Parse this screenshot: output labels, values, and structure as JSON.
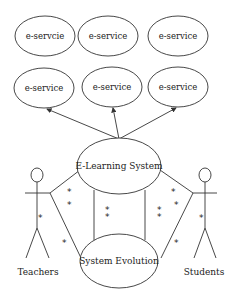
{
  "diagram": {
    "top_services": [
      {
        "label": "e-servcie"
      },
      {
        "label": "e-service"
      },
      {
        "label": "e-service"
      }
    ],
    "mid_services": [
      {
        "label": "e-service"
      },
      {
        "label": "e-service"
      },
      {
        "label": "e-service"
      }
    ],
    "core_system": {
      "label": "E-Learning System"
    },
    "evolution": {
      "label": "System Evolution"
    },
    "actors": [
      {
        "label": "Teachers"
      },
      {
        "label": "Students"
      }
    ],
    "multiplicity_symbol": "*",
    "colors": {
      "stroke": "#333333",
      "background": "#ffffff",
      "text": "#222222"
    }
  }
}
